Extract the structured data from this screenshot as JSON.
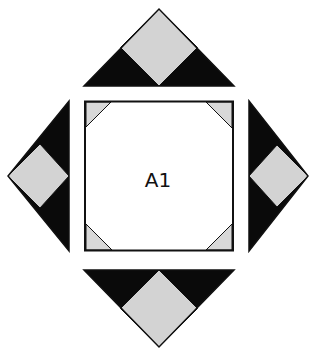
{
  "diagram": {
    "type": "quilt-block-layout",
    "center_label": "A1",
    "colors": {
      "dark": "#0a0a0a",
      "light": "#d3d3d3",
      "background": "#ffffff",
      "stroke": "#111111"
    },
    "pieces": [
      {
        "id": "top-triangle",
        "description": "Triangle above block with gray square-on-point and two black corner triangles"
      },
      {
        "id": "left-triangle",
        "description": "Triangle left of block with gray square-on-point and two black corner triangles"
      },
      {
        "id": "right-triangle",
        "description": "Triangle right of block with gray square-on-point and two black corner triangles"
      },
      {
        "id": "bottom-triangle",
        "description": "Triangle below block with gray square-on-point and two black corner triangles"
      },
      {
        "id": "center-square",
        "label": "A1",
        "description": "White square with four light gray corner triangles"
      }
    ]
  }
}
